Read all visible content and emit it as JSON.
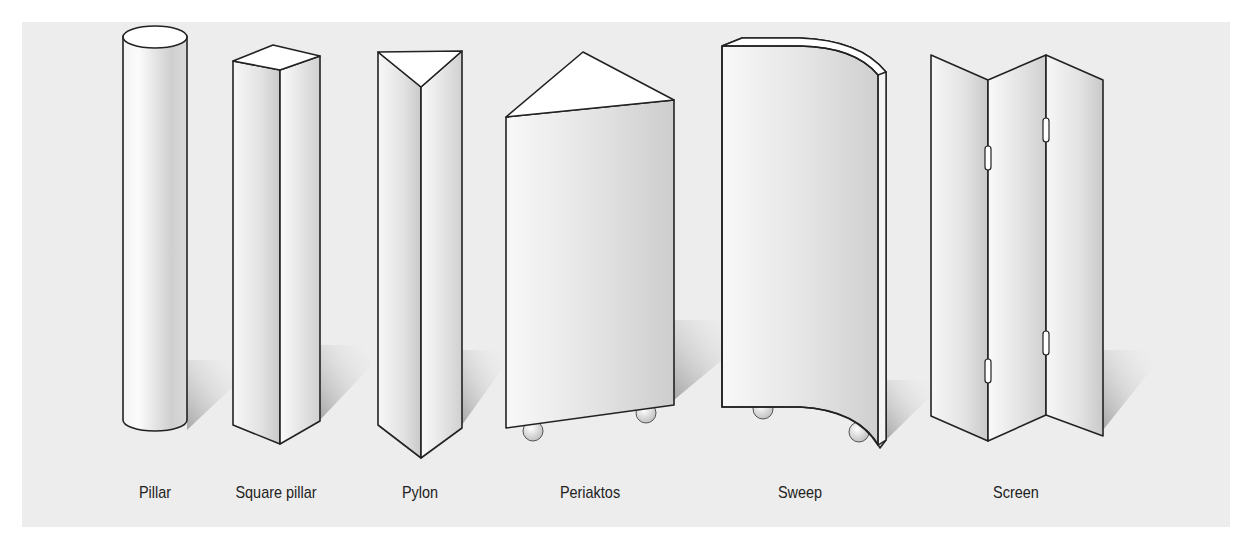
{
  "figure": {
    "background_color": "#ededed",
    "outline_color": "#222222",
    "shapes": [
      {
        "id": "pillar",
        "label": "Pillar"
      },
      {
        "id": "square-pillar",
        "label": "Square pillar"
      },
      {
        "id": "pylon",
        "label": "Pylon"
      },
      {
        "id": "periaktos",
        "label": "Periaktos"
      },
      {
        "id": "sweep",
        "label": "Sweep"
      },
      {
        "id": "screen",
        "label": "Screen"
      }
    ]
  }
}
